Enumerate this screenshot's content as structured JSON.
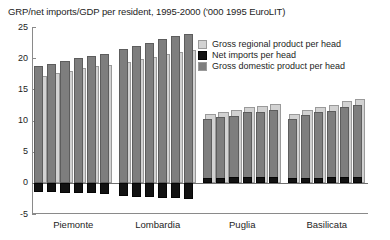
{
  "chart_data": {
    "type": "bar",
    "title": "GRP/net imports/GDP per resident, 1995-2000 ('000 1995 EuroLIT)",
    "xlabel": "",
    "ylabel": "",
    "ylim": [
      -5,
      25
    ],
    "yticks": [
      25,
      20,
      15,
      10,
      5,
      0,
      -5
    ],
    "grid": false,
    "legend_position": "inside-top-right",
    "categories": [
      "Piemonte",
      "Lombardia",
      "Puglia",
      "Basilicata"
    ],
    "years": [
      "1995",
      "1996",
      "1997",
      "1998",
      "1999",
      "2000"
    ],
    "legend": [
      "Gross regional product per head",
      "Net imports per head",
      "Gross domestic product per head"
    ],
    "colors": {
      "gross_regional_product": "#d2d2d2",
      "net_imports": "#121212",
      "gross_domestic_product": "#7e7e7e",
      "axis": "#8a8a8a",
      "background": "#ffffff"
    },
    "series": [
      {
        "name": "Gross regional product per head",
        "groups": [
          {
            "category": "Piemonte",
            "values": [
              17.2,
              17.6,
              17.9,
              18.4,
              18.7,
              18.9
            ]
          },
          {
            "category": "Lombardia",
            "values": [
              19.4,
              19.8,
              20.2,
              20.6,
              21.0,
              21.3
            ]
          },
          {
            "category": "Puglia",
            "values": [
              11.0,
              11.4,
              11.7,
              12.2,
              12.4,
              12.7
            ]
          },
          {
            "category": "Basilicata",
            "values": [
              11.0,
              11.7,
              12.2,
              12.5,
              13.1,
              13.5
            ]
          }
        ]
      },
      {
        "name": "Net imports per head",
        "groups": [
          {
            "category": "Piemonte",
            "values": [
              -1.5,
              -1.5,
              -1.6,
              -1.6,
              -1.7,
              -1.8
            ]
          },
          {
            "category": "Lombardia",
            "values": [
              -2.1,
              -2.2,
              -2.3,
              -2.4,
              -2.5,
              -2.6
            ]
          },
          {
            "category": "Puglia",
            "values": [
              0.8,
              0.8,
              0.9,
              0.9,
              1.0,
              1.0
            ]
          },
          {
            "category": "Basilicata",
            "values": [
              0.7,
              0.8,
              0.8,
              0.9,
              0.9,
              1.0
            ]
          }
        ]
      },
      {
        "name": "Gross domestic product per head",
        "groups": [
          {
            "category": "Piemonte",
            "values": [
              18.7,
              19.1,
              19.5,
              20.0,
              20.4,
              20.7
            ]
          },
          {
            "category": "Lombardia",
            "values": [
              21.5,
              22.0,
              22.5,
              23.0,
              23.5,
              23.9
            ]
          },
          {
            "category": "Puglia",
            "values": [
              10.2,
              10.6,
              10.8,
              11.3,
              11.4,
              11.7
            ]
          },
          {
            "category": "Basilicata",
            "values": [
              10.3,
              10.9,
              11.4,
              11.6,
              12.2,
              12.5
            ]
          }
        ]
      }
    ]
  }
}
